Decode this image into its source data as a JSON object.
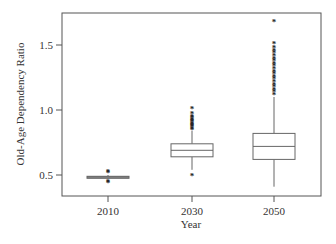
{
  "chart_data": {
    "type": "box",
    "title": "",
    "xlabel": "Year",
    "ylabel": "Old-Age Dependency Ratio",
    "categories": [
      "2010",
      "2030",
      "2050"
    ],
    "yticks": [
      0.5,
      1.0,
      1.5
    ],
    "ytick_labels": [
      "0.5",
      "1.0",
      "1.5"
    ],
    "ylim": [
      0.36,
      1.74
    ],
    "grid": false,
    "legend": null,
    "series": [
      {
        "name": "2010",
        "whisker_low": 0.47,
        "q1": 0.475,
        "median": 0.485,
        "q3": 0.49,
        "whisker_high": 0.5,
        "outliers": [
          0.44,
          0.45,
          0.52,
          0.53
        ]
      },
      {
        "name": "2030",
        "whisker_low": 0.54,
        "q1": 0.64,
        "median": 0.69,
        "q3": 0.74,
        "whisker_high": 0.84,
        "outliers": [
          0.5,
          0.85,
          0.86,
          0.87,
          0.88,
          0.89,
          0.9,
          0.91,
          0.92,
          0.93,
          0.94,
          0.95,
          0.97,
          1.01
        ]
      },
      {
        "name": "2050",
        "whisker_low": 0.41,
        "q1": 0.62,
        "median": 0.72,
        "q3": 0.82,
        "whisker_high": 1.1,
        "outliers": [
          1.12,
          1.14,
          1.16,
          1.18,
          1.2,
          1.22,
          1.24,
          1.26,
          1.28,
          1.3,
          1.32,
          1.34,
          1.36,
          1.38,
          1.4,
          1.42,
          1.44,
          1.46,
          1.48,
          1.51,
          1.68
        ]
      }
    ]
  },
  "colors": {
    "frame": "#555555",
    "box_stroke": "#666666",
    "box_2010_fill": "#999999",
    "outlier": "#222222",
    "text": "#333333"
  }
}
